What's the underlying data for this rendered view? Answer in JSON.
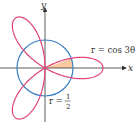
{
  "figure": {
    "axes": {
      "x_label": "x",
      "y_label": "y"
    },
    "curves": [
      {
        "name": "rose",
        "equation_label": "r = cos 3θ",
        "color": "#e0447a"
      },
      {
        "name": "circle",
        "equation_label_prefix": "r =",
        "fraction": {
          "numerator": "1",
          "denominator": "2"
        },
        "color": "#3a7fc4"
      }
    ],
    "shaded_region": {
      "color": "#f8c9a0",
      "description": "region inside rose petal and inside circle, first quadrant"
    }
  }
}
